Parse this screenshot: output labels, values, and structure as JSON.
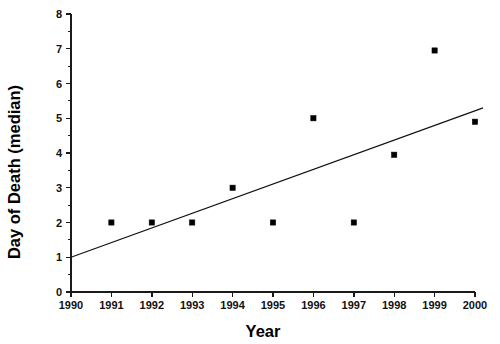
{
  "chart_data": {
    "type": "scatter",
    "title": "",
    "xlabel": "Year",
    "ylabel": "Day of Death (median)",
    "xlim": [
      1990,
      2000
    ],
    "ylim": [
      0,
      8
    ],
    "grid": false,
    "legend": "none",
    "x_ticks": [
      "1990",
      "1991",
      "1992",
      "1993",
      "1994",
      "1995",
      "1996",
      "1997",
      "1998",
      "1999",
      "2000"
    ],
    "x_tick_values": [
      1990,
      1991,
      1992,
      1993,
      1994,
      1995,
      1996,
      1997,
      1998,
      1999,
      2000
    ],
    "y_ticks": [
      "0",
      "1",
      "2",
      "3",
      "4",
      "5",
      "6",
      "7",
      "8"
    ],
    "y_tick_values": [
      0,
      1,
      2,
      3,
      4,
      5,
      6,
      7,
      8
    ],
    "y_minor_ticks": [
      0.5,
      1.5,
      2.5,
      3.5,
      4.5,
      5.5,
      6.5,
      7.5
    ],
    "series": [
      {
        "name": "Day of Death (median)",
        "marker": "square",
        "color": "#000000",
        "x": [
          1991,
          1992,
          1993,
          1994,
          1995,
          1996,
          1997,
          1998,
          1999,
          2000
        ],
        "y": [
          2.0,
          2.0,
          2.0,
          3.0,
          2.0,
          5.0,
          2.0,
          3.95,
          6.95,
          4.9
        ]
      }
    ],
    "trend_line": {
      "name": "linear fit",
      "color": "#111111",
      "x": [
        1990,
        2000.2
      ],
      "y": [
        1.0,
        5.3
      ]
    }
  },
  "axes": {
    "x_axis_name": "x-axis",
    "y_axis_name": "y-axis"
  }
}
